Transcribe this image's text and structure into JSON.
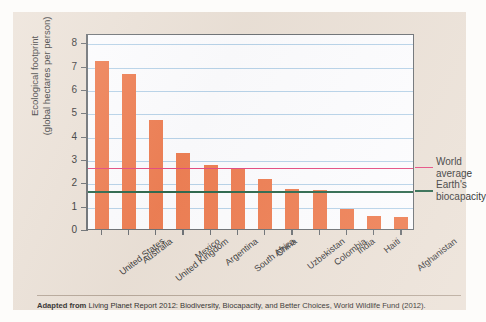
{
  "chart_data": {
    "type": "bar",
    "title": "",
    "xlabel": "",
    "ylabel": "Ecological footprint\n(global hectares per person)",
    "ylim": [
      0,
      8.4
    ],
    "yticks": [
      0,
      1,
      2,
      3,
      4,
      5,
      6,
      7,
      8
    ],
    "grid": true,
    "legend_position": "right-annotations",
    "bar_color": "#ef8055",
    "categories": [
      "United States",
      "Australia",
      "United Kingdom",
      "Mexico",
      "Argentina",
      "South Africa",
      "China",
      "Uzbekistan",
      "Colombia",
      "India",
      "Haiti",
      "Afghanistan"
    ],
    "values": [
      7.2,
      6.65,
      4.68,
      3.25,
      2.75,
      2.58,
      2.13,
      1.7,
      1.68,
      0.85,
      0.55,
      0.5
    ],
    "reference_lines": [
      {
        "label": "World\naverage",
        "value": 2.7,
        "color": "#e64d82"
      },
      {
        "label": "Earth's\nbiocapacity",
        "value": 1.7,
        "color": "#2f6a4f"
      }
    ]
  },
  "caption": {
    "lead": "Adapted from",
    "text": " Living Planet Report 2012: Biodiversity, Biocapacity, and Better Choices, World Wildlife Fund (2012)."
  }
}
